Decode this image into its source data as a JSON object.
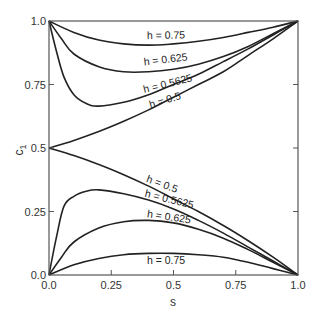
{
  "chart_data": {
    "type": "line",
    "title": "",
    "xlabel": "s",
    "ylabel": "c1",
    "xlim": [
      0,
      1
    ],
    "ylim": [
      0,
      1
    ],
    "grid": false,
    "legend": "inline curve labels",
    "x_ticks": [
      "0.0",
      "0.25",
      "0.5",
      "0.75",
      "1.0"
    ],
    "y_ticks": [
      "0.0",
      "0.25",
      "0.5",
      "0.75",
      "1.0"
    ],
    "series": [
      {
        "name": "h = 0.75 (upper)",
        "label": "h = 0.75",
        "branch": "upper",
        "points": [
          [
            0,
            1.0
          ],
          [
            0.1,
            0.955
          ],
          [
            0.2,
            0.925
          ],
          [
            0.3,
            0.91
          ],
          [
            0.4,
            0.905
          ],
          [
            0.5,
            0.91
          ],
          [
            0.6,
            0.92
          ],
          [
            0.7,
            0.935
          ],
          [
            0.8,
            0.955
          ],
          [
            0.9,
            0.975
          ],
          [
            1,
            1.0
          ]
        ]
      },
      {
        "name": "h = 0.625 (upper)",
        "label": "h = 0.625",
        "branch": "upper",
        "points": [
          [
            0,
            1.0
          ],
          [
            0.05,
            0.93
          ],
          [
            0.1,
            0.87
          ],
          [
            0.2,
            0.82
          ],
          [
            0.3,
            0.8
          ],
          [
            0.4,
            0.8
          ],
          [
            0.5,
            0.81
          ],
          [
            0.6,
            0.83
          ],
          [
            0.7,
            0.86
          ],
          [
            0.8,
            0.9
          ],
          [
            0.9,
            0.95
          ],
          [
            1,
            1.0
          ]
        ]
      },
      {
        "name": "h = 0.5625 (upper)",
        "label": "h = 0.5625",
        "branch": "upper",
        "points": [
          [
            0,
            1.0
          ],
          [
            0.03,
            0.88
          ],
          [
            0.06,
            0.78
          ],
          [
            0.1,
            0.71
          ],
          [
            0.15,
            0.675
          ],
          [
            0.2,
            0.665
          ],
          [
            0.3,
            0.68
          ],
          [
            0.4,
            0.71
          ],
          [
            0.5,
            0.75
          ],
          [
            0.6,
            0.79
          ],
          [
            0.7,
            0.84
          ],
          [
            0.8,
            0.89
          ],
          [
            0.9,
            0.945
          ],
          [
            1,
            1.0
          ]
        ]
      },
      {
        "name": "h = 0.5 (upper)",
        "label": "h = 0.5",
        "branch": "upper",
        "points": [
          [
            0,
            0.5
          ],
          [
            0.1,
            0.53
          ],
          [
            0.2,
            0.565
          ],
          [
            0.3,
            0.605
          ],
          [
            0.4,
            0.65
          ],
          [
            0.5,
            0.7
          ],
          [
            0.6,
            0.75
          ],
          [
            0.7,
            0.8
          ],
          [
            0.8,
            0.865
          ],
          [
            0.9,
            0.93
          ],
          [
            1,
            1.0
          ]
        ]
      },
      {
        "name": "h = 0.5 (lower)",
        "label": "h = 0.5",
        "branch": "lower",
        "points": [
          [
            0,
            0.5
          ],
          [
            0.1,
            0.47
          ],
          [
            0.2,
            0.435
          ],
          [
            0.3,
            0.395
          ],
          [
            0.4,
            0.35
          ],
          [
            0.5,
            0.3
          ],
          [
            0.6,
            0.25
          ],
          [
            0.7,
            0.195
          ],
          [
            0.8,
            0.135
          ],
          [
            0.9,
            0.07
          ],
          [
            1,
            0.0
          ]
        ]
      },
      {
        "name": "h = 0.5625 (lower)",
        "label": "h = 0.5625",
        "branch": "lower",
        "points": [
          [
            0,
            0.0
          ],
          [
            0.03,
            0.15
          ],
          [
            0.06,
            0.27
          ],
          [
            0.1,
            0.31
          ],
          [
            0.15,
            0.33
          ],
          [
            0.2,
            0.335
          ],
          [
            0.3,
            0.32
          ],
          [
            0.4,
            0.295
          ],
          [
            0.5,
            0.26
          ],
          [
            0.6,
            0.215
          ],
          [
            0.7,
            0.165
          ],
          [
            0.8,
            0.11
          ],
          [
            0.9,
            0.055
          ],
          [
            1,
            0.0
          ]
        ]
      },
      {
        "name": "h = 0.625 (lower)",
        "label": "h = 0.625",
        "branch": "lower",
        "points": [
          [
            0,
            0.0
          ],
          [
            0.05,
            0.07
          ],
          [
            0.1,
            0.13
          ],
          [
            0.2,
            0.185
          ],
          [
            0.3,
            0.21
          ],
          [
            0.4,
            0.215
          ],
          [
            0.5,
            0.205
          ],
          [
            0.6,
            0.18
          ],
          [
            0.7,
            0.145
          ],
          [
            0.8,
            0.1
          ],
          [
            0.9,
            0.05
          ],
          [
            1,
            0.0
          ]
        ]
      },
      {
        "name": "h = 0.75 (lower)",
        "label": "h = 0.75",
        "branch": "lower",
        "points": [
          [
            0,
            0.0
          ],
          [
            0.1,
            0.04
          ],
          [
            0.2,
            0.065
          ],
          [
            0.3,
            0.08
          ],
          [
            0.4,
            0.085
          ],
          [
            0.5,
            0.085
          ],
          [
            0.6,
            0.08
          ],
          [
            0.7,
            0.07
          ],
          [
            0.8,
            0.05
          ],
          [
            0.9,
            0.025
          ],
          [
            1,
            0.0
          ]
        ]
      }
    ],
    "annotations": [
      {
        "text": "h = 0.75",
        "x": 0.47,
        "y": 0.93,
        "angle": -1
      },
      {
        "text": "h = 0.625",
        "x": 0.47,
        "y": 0.835,
        "angle": -7
      },
      {
        "text": "h = 0.5625",
        "x": 0.48,
        "y": 0.74,
        "angle": -14
      },
      {
        "text": "h = 0.5",
        "x": 0.47,
        "y": 0.675,
        "angle": -17
      },
      {
        "text": "h = 0.5",
        "x": 0.45,
        "y": 0.345,
        "angle": 20
      },
      {
        "text": "h = 0.5625",
        "x": 0.48,
        "y": 0.285,
        "angle": 14
      },
      {
        "text": "h = 0.625",
        "x": 0.48,
        "y": 0.215,
        "angle": 8
      },
      {
        "text": "h = 0.75",
        "x": 0.47,
        "y": 0.045,
        "angle": 0
      }
    ]
  },
  "axes": {
    "xlabel": "s",
    "ylabel_main": "c",
    "ylabel_sub": "1"
  }
}
